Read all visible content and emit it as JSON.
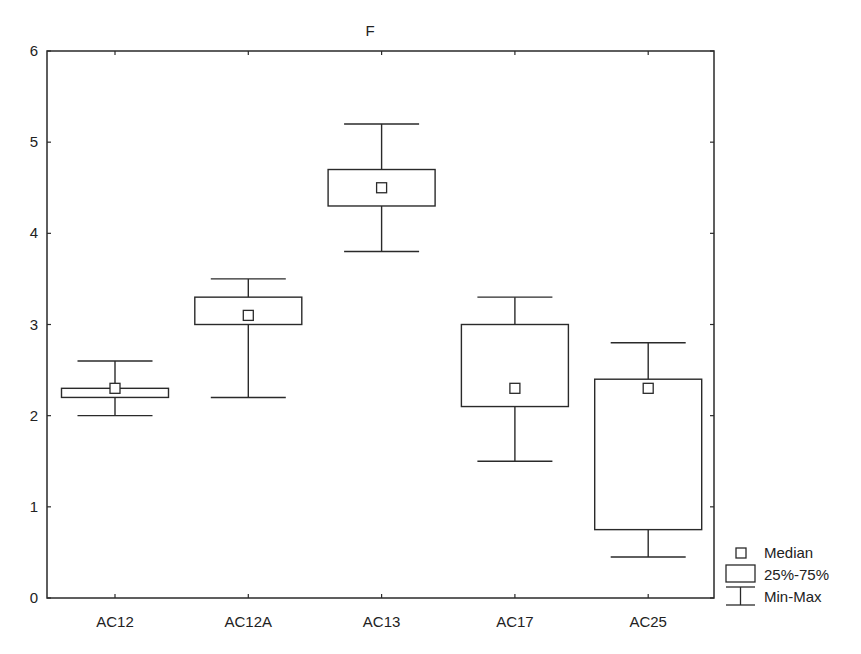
{
  "chart_data": {
    "type": "box",
    "title": "F",
    "xlabel": "",
    "ylabel": "",
    "ylim": [
      0,
      6
    ],
    "yticks": [
      0,
      1,
      2,
      3,
      4,
      5,
      6
    ],
    "grid": false,
    "legend_position": "bottom-right outside",
    "categories": [
      "AC12",
      "AC12A",
      "AC13",
      "AC17",
      "AC25"
    ],
    "series": [
      {
        "name": "AC12",
        "min": 2.0,
        "q1": 2.2,
        "median": 2.3,
        "q3": 2.3,
        "max": 2.6
      },
      {
        "name": "AC12A",
        "min": 2.2,
        "q1": 3.0,
        "median": 3.1,
        "q3": 3.3,
        "max": 3.5
      },
      {
        "name": "AC13",
        "min": 3.8,
        "q1": 4.3,
        "median": 4.5,
        "q3": 4.7,
        "max": 5.2
      },
      {
        "name": "AC17",
        "min": 1.5,
        "q1": 2.1,
        "median": 2.3,
        "q3": 3.0,
        "max": 3.3
      },
      {
        "name": "AC25",
        "min": 0.45,
        "q1": 0.75,
        "median": 2.3,
        "q3": 2.4,
        "max": 2.8
      }
    ],
    "legend": [
      {
        "symbol": "median-square",
        "label": "Median"
      },
      {
        "symbol": "box",
        "label": "25%-75%"
      },
      {
        "symbol": "whisker",
        "label": "Min-Max"
      }
    ]
  },
  "style": {
    "line_color": "#2a2a2a",
    "background": "#ffffff"
  }
}
